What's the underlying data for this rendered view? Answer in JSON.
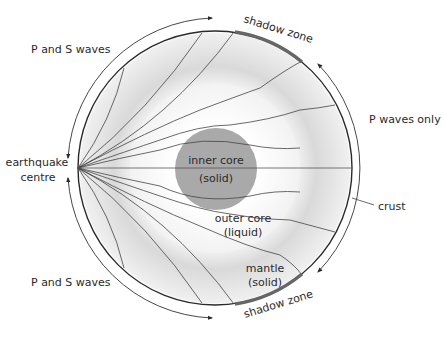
{
  "diagram": {
    "labels": {
      "p_and_s_waves_top": "P and S waves",
      "p_and_s_waves_bottom": "P and S waves",
      "p_waves_only": "P waves only",
      "earthquake_line1": "earthquake",
      "earthquake_line2": "centre",
      "shadow_zone_top": "shadow zone",
      "shadow_zone_bottom": "shadow zone",
      "inner_core_line1": "inner core",
      "inner_core_line2": "(solid)",
      "outer_core_line1": "outer core",
      "outer_core_line2": "(liquid)",
      "mantle_line1": "mantle",
      "mantle_line2": "(solid)",
      "crust": "crust"
    },
    "colors": {
      "mantle": "#e6e6e6",
      "outer_core": "#f7f7f7",
      "inner_core": "#a8a8a8",
      "shadow_zone": "#6a6a6a",
      "lines": "#3a3a3a"
    }
  }
}
